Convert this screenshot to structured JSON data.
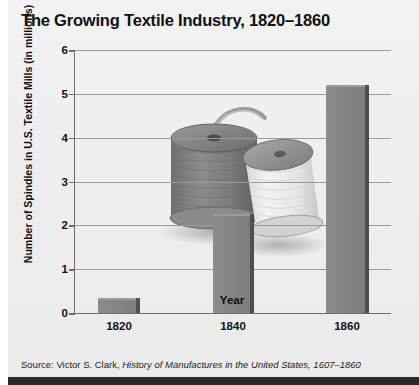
{
  "chart_data": {
    "type": "bar",
    "title": "The Growing Textile Industry, 1820–1860",
    "xlabel": "Year",
    "ylabel": "Number of Spindles in U.S. Textile Mills (in millions)",
    "categories": [
      "1820",
      "1840",
      "1860"
    ],
    "values": [
      0.35,
      2.25,
      5.2
    ],
    "ylim": [
      0,
      6
    ],
    "yticks": [
      "6",
      "5",
      "4",
      "3",
      "2",
      "1",
      "0"
    ],
    "ytick_values": [
      6,
      5,
      4,
      3,
      2,
      1,
      0
    ],
    "grid": true,
    "legend": "none",
    "bar_color": "#848484",
    "bar_edge_color": "#4f4f4f"
  },
  "source": {
    "prefix": "Source: Victor S. Clark, ",
    "title": "History of Manufactures in the United States, 1607–1860"
  },
  "decoration": {
    "spools_alt": "two thread spools"
  }
}
